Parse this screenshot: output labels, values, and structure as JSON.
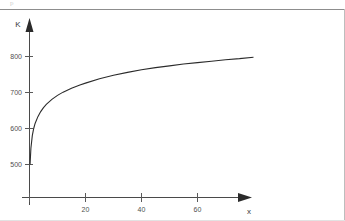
{
  "figure": {
    "artifact_text": "p",
    "y_axis_name": "K",
    "x_axis_name": "x"
  },
  "chart_data": {
    "type": "line",
    "title": "",
    "subtitle": "",
    "xlabel": "x",
    "ylabel": "K",
    "xlim": [
      0,
      86
    ],
    "ylim": [
      470,
      830
    ],
    "grid": false,
    "legend": null,
    "x_ticks": [
      20,
      40,
      60
    ],
    "x_tick_labels": [
      "20",
      "40",
      "60"
    ],
    "y_ticks": [
      500,
      600,
      700,
      800
    ],
    "y_tick_labels": [
      "500",
      "600",
      "700",
      "800"
    ],
    "axis_arrows": [
      "x",
      "y"
    ],
    "series": [
      {
        "name": "K(x)",
        "color": "#2b2b2b",
        "x": [
          0.2,
          0.5,
          1,
          1.5,
          2,
          3,
          4,
          5,
          6,
          8,
          10,
          12,
          15,
          18,
          20,
          25,
          30,
          35,
          40,
          45,
          50,
          55,
          60,
          65,
          70,
          75,
          80
        ],
        "y": [
          500,
          545,
          580,
          600,
          614,
          633,
          647,
          658,
          667,
          681,
          692,
          701,
          712,
          721,
          726,
          738,
          748,
          756,
          763,
          769,
          774,
          779,
          783,
          787,
          791,
          794,
          798
        ]
      }
    ],
    "annotations": []
  }
}
